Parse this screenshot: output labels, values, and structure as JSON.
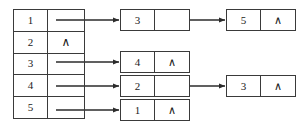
{
  "diagram": {
    "kind": "adjacency-list",
    "null_symbol": "∧",
    "colors": {
      "stroke": "#3a3a3a",
      "text": "#1a1a1a",
      "background": "#ffffff"
    },
    "array": {
      "label": "vertex-array",
      "rows": [
        {
          "index": "1",
          "next": ""
        },
        {
          "index": "2",
          "next": "∧"
        },
        {
          "index": "3",
          "next": ""
        },
        {
          "index": "4",
          "next": ""
        },
        {
          "index": "5",
          "next": ""
        }
      ]
    },
    "nodes": [
      {
        "id": "n-3a",
        "value": "3",
        "next": ""
      },
      {
        "id": "n-5",
        "value": "5",
        "next": "∧"
      },
      {
        "id": "n-4",
        "value": "4",
        "next": "∧"
      },
      {
        "id": "n-2",
        "value": "2",
        "next": ""
      },
      {
        "id": "n-1",
        "value": "1",
        "next": "∧"
      },
      {
        "id": "n-3b",
        "value": "3",
        "next": "∧"
      }
    ],
    "edges": [
      {
        "from": "array-row-1",
        "to": "n-3a"
      },
      {
        "from": "n-3a",
        "to": "n-5"
      },
      {
        "from": "array-row-3",
        "to": "n-4"
      },
      {
        "from": "array-row-4",
        "to": "n-2"
      },
      {
        "from": "array-row-5",
        "to": "n-1"
      },
      {
        "from": "n-2",
        "to": "n-3b"
      }
    ]
  }
}
